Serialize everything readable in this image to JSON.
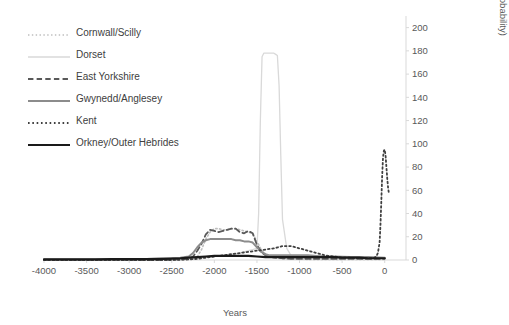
{
  "chart_data": {
    "type": "line",
    "title": "",
    "xlabel": "Years",
    "ylabel": "No. of cremation burials (summed probability)",
    "xlim": [
      -4000,
      250
    ],
    "ylim": [
      0,
      210
    ],
    "xticks": [
      -4000,
      -3500,
      -3000,
      -2500,
      -2000,
      -1500,
      -1000,
      -500,
      0
    ],
    "xticklabels": [
      "-4000",
      "-3500",
      "-3000",
      "-2500",
      "-2000",
      "-1500",
      "-1000",
      "-500",
      "0"
    ],
    "yticks": [
      0,
      20,
      40,
      60,
      80,
      100,
      120,
      140,
      160,
      180,
      200
    ],
    "yticklabels": [
      "0",
      "20",
      "40",
      "60",
      "80",
      "100",
      "120",
      "140",
      "160",
      "180",
      "200"
    ],
    "grid": false,
    "legend_position": "top-left",
    "series": [
      {
        "name": "Cornwall/Scilly",
        "style": "dotted",
        "color": "#bfbfbf",
        "width": 1.6,
        "x": [
          -4000,
          -3000,
          -2600,
          -2400,
          -2300,
          -2200,
          -2150,
          -2100,
          -2050,
          -2000,
          -1950,
          -1900,
          -1850,
          -1800,
          -1750,
          -1700,
          -1650,
          -1600,
          -1550,
          -1500,
          -1450,
          -1400,
          -1350,
          -1300,
          -1200,
          -1100,
          -1000,
          -900,
          -800,
          -600,
          -400,
          -200,
          0
        ],
        "y": [
          0,
          0,
          0,
          0.5,
          1,
          3,
          9,
          18,
          24,
          27,
          27,
          26,
          26,
          27,
          27,
          26,
          25,
          24,
          23,
          16,
          9,
          5,
          3,
          2,
          1,
          1,
          1,
          0.5,
          0.5,
          0.5,
          0.5,
          0.5,
          0.5
        ]
      },
      {
        "name": "Dorset",
        "style": "solid",
        "color": "#d9d9d9",
        "width": 1.3,
        "x": [
          -4000,
          -3000,
          -2500,
          -2300,
          -2200,
          -2100,
          -2000,
          -1900,
          -1800,
          -1700,
          -1650,
          -1600,
          -1550,
          -1500,
          -1480,
          -1460,
          -1440,
          -1420,
          -1400,
          -1380,
          -1350,
          -1320,
          -1300,
          -1280,
          -1260,
          -1240,
          -1220,
          -1200,
          -1150,
          -1100,
          -1000,
          -800,
          -600,
          -400,
          -200,
          0
        ],
        "y": [
          0,
          0,
          0,
          0.5,
          1,
          2,
          3,
          4,
          5,
          6,
          7,
          8,
          9,
          10,
          40,
          120,
          175,
          178,
          178,
          178,
          178,
          178,
          178,
          177,
          176,
          150,
          90,
          35,
          10,
          4,
          2,
          1,
          1,
          1,
          1,
          1
        ]
      },
      {
        "name": "East Yorkshire",
        "style": "dashed",
        "color": "#595959",
        "width": 1.8,
        "x": [
          -4000,
          -3000,
          -2600,
          -2400,
          -2300,
          -2250,
          -2200,
          -2150,
          -2100,
          -2050,
          -2000,
          -1950,
          -1900,
          -1850,
          -1800,
          -1750,
          -1700,
          -1650,
          -1600,
          -1550,
          -1500,
          -1450,
          -1400,
          -1350,
          -1300,
          -1250,
          -1200,
          -1100,
          -1000,
          -800,
          -600,
          -400,
          -200,
          0
        ],
        "y": [
          0,
          0,
          0,
          0.5,
          1,
          3,
          8,
          14,
          22,
          26,
          25,
          24,
          25,
          26,
          27,
          27,
          24,
          23,
          25,
          23,
          13,
          7,
          4,
          3,
          2,
          2,
          1.5,
          1,
          1,
          1,
          1,
          1,
          1,
          1
        ]
      },
      {
        "name": "Gwynedd/Anglesey",
        "style": "solid",
        "color": "#8c8c8c",
        "width": 2,
        "x": [
          -4000,
          -3500,
          -3000,
          -2700,
          -2500,
          -2400,
          -2300,
          -2250,
          -2200,
          -2150,
          -2100,
          -2050,
          -2000,
          -1950,
          -1900,
          -1850,
          -1800,
          -1750,
          -1700,
          -1650,
          -1600,
          -1550,
          -1500,
          -1450,
          -1400,
          -1350,
          -1300,
          -1250,
          -1200,
          -1150,
          -1100,
          -1000,
          -900,
          -800,
          -700,
          -600,
          -400,
          -200,
          0
        ],
        "y": [
          0.5,
          0.5,
          0.5,
          1,
          1.5,
          2,
          3,
          6,
          11,
          15,
          17,
          18,
          18,
          18,
          18,
          18,
          18,
          17,
          17,
          16,
          16,
          15,
          11,
          7,
          5,
          4,
          4,
          4,
          4,
          4,
          4,
          4,
          4,
          3.5,
          3,
          3,
          2.5,
          2.5,
          2
        ]
      },
      {
        "name": "Kent",
        "style": "dotted",
        "color": "#404040",
        "width": 1.8,
        "x": [
          -4000,
          -3000,
          -2500,
          -2300,
          -2200,
          -2100,
          -2000,
          -1900,
          -1800,
          -1700,
          -1600,
          -1500,
          -1400,
          -1300,
          -1250,
          -1200,
          -1150,
          -1100,
          -1050,
          -1000,
          -950,
          -900,
          -850,
          -800,
          -700,
          -600,
          -500,
          -400,
          -300,
          -250,
          -200,
          -150,
          -120,
          -100,
          -80,
          -60,
          -50,
          -40,
          -30,
          -20,
          -10,
          0,
          10,
          20,
          30,
          40,
          50
        ],
        "y": [
          0,
          0,
          0,
          0.5,
          1,
          2,
          3,
          4,
          5,
          6,
          7,
          8,
          9,
          10,
          11,
          12,
          12,
          12,
          11,
          10,
          9,
          8,
          7,
          6,
          4,
          3,
          2,
          2,
          1.5,
          1.5,
          1.5,
          1.5,
          2,
          3,
          6,
          15,
          30,
          50,
          72,
          88,
          94,
          95,
          90,
          80,
          70,
          62,
          57
        ]
      },
      {
        "name": "Orkney/Outer Hebrides",
        "style": "solid",
        "color": "#1a1a1a",
        "width": 2.2,
        "x": [
          -4000,
          -3800,
          -3600,
          -3400,
          -3200,
          -3000,
          -2800,
          -2600,
          -2500,
          -2400,
          -2300,
          -2200,
          -2100,
          -2000,
          -1900,
          -1800,
          -1700,
          -1600,
          -1500,
          -1400,
          -1300,
          -1200,
          -1100,
          -1000,
          -900,
          -800,
          -700,
          -600,
          -500,
          -400,
          -300,
          -200,
          -100,
          0
        ],
        "y": [
          0.5,
          0.5,
          0.6,
          0.6,
          0.7,
          0.8,
          0.8,
          1,
          1.2,
          1.5,
          2,
          2.5,
          3,
          3.5,
          3.5,
          3.5,
          3.5,
          3.5,
          3,
          2.5,
          2.5,
          2.5,
          2.5,
          2.5,
          2.5,
          2.5,
          2.5,
          2.5,
          2,
          2,
          2,
          1.5,
          1.5,
          1.5
        ]
      }
    ]
  },
  "legend": {
    "items": [
      {
        "label": "Cornwall/Scilly"
      },
      {
        "label": "Dorset"
      },
      {
        "label": "East Yorkshire"
      },
      {
        "label": "Gwynedd/Anglesey"
      },
      {
        "label": "Kent"
      },
      {
        "label": "Orkney/Outer Hebrides"
      }
    ]
  },
  "axes": {
    "x_title": "Years",
    "y_title": "No. of cremation burials (summed probability)"
  }
}
